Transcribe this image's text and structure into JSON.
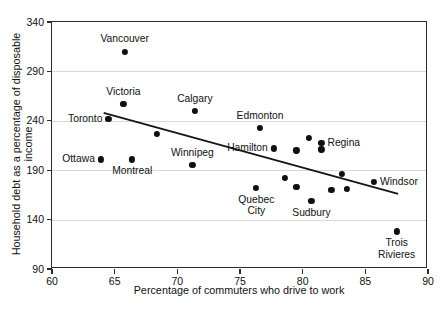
{
  "chart_data": {
    "type": "scatter",
    "title": "",
    "xlabel": "Percentage of commuters who drive to work",
    "ylabel": "Household debt as a percentage of disposable income",
    "xlim": [
      60,
      90
    ],
    "ylim": [
      90,
      340
    ],
    "xticks": [
      60,
      65,
      70,
      75,
      80,
      85,
      90
    ],
    "yticks": [
      90,
      140,
      190,
      240,
      290,
      340
    ],
    "grid": "horizontal",
    "legend": "none",
    "trendline": {
      "x0": 64.2,
      "y0": 247,
      "x1": 87.7,
      "y1": 165
    },
    "points": [
      {
        "label": "Vancouver",
        "x": 65.8,
        "y": 310,
        "label_pos": "above"
      },
      {
        "label": "Victoria",
        "x": 65.7,
        "y": 257,
        "label_pos": "above"
      },
      {
        "label": "Toronto",
        "x": 64.5,
        "y": 242,
        "label_pos": "left"
      },
      {
        "label": "Calgary",
        "x": 71.4,
        "y": 250,
        "label_pos": "above"
      },
      {
        "label": "Ottawa",
        "x": 63.9,
        "y": 201,
        "label_pos": "left"
      },
      {
        "label": "Montreal",
        "x": 66.4,
        "y": 201,
        "label_pos": "below"
      },
      {
        "label": "Winnipeg",
        "x": 71.2,
        "y": 195,
        "label_pos": "above"
      },
      {
        "label": "Edmonton",
        "x": 76.6,
        "y": 233,
        "label_pos": "above"
      },
      {
        "label": "Hamilton",
        "x": 77.7,
        "y": 212,
        "label_pos": "left"
      },
      {
        "label": "Regina",
        "x": 81.5,
        "y": 218,
        "label_pos": "right"
      },
      {
        "label": "Quebec\nCity",
        "x": 76.3,
        "y": 172,
        "label_pos": "below"
      },
      {
        "label": "Sudbury",
        "x": 80.7,
        "y": 159,
        "label_pos": "below"
      },
      {
        "label": "Windsor",
        "x": 85.7,
        "y": 178,
        "label_pos": "right"
      },
      {
        "label": "Trois\nRivieres",
        "x": 87.5,
        "y": 128,
        "label_pos": "below"
      },
      {
        "label": "",
        "x": 68.4,
        "y": 227
      },
      {
        "label": "",
        "x": 79.5,
        "y": 210
      },
      {
        "label": "",
        "x": 80.5,
        "y": 223
      },
      {
        "label": "",
        "x": 81.5,
        "y": 211
      },
      {
        "label": "",
        "x": 78.6,
        "y": 182
      },
      {
        "label": "",
        "x": 79.5,
        "y": 173
      },
      {
        "label": "",
        "x": 82.3,
        "y": 170
      },
      {
        "label": "",
        "x": 83.1,
        "y": 186
      },
      {
        "label": "",
        "x": 83.5,
        "y": 171
      }
    ],
    "colors": {
      "marker": "#101010",
      "axis": "#2b2b2b",
      "grid": "#d8d8d8"
    }
  }
}
